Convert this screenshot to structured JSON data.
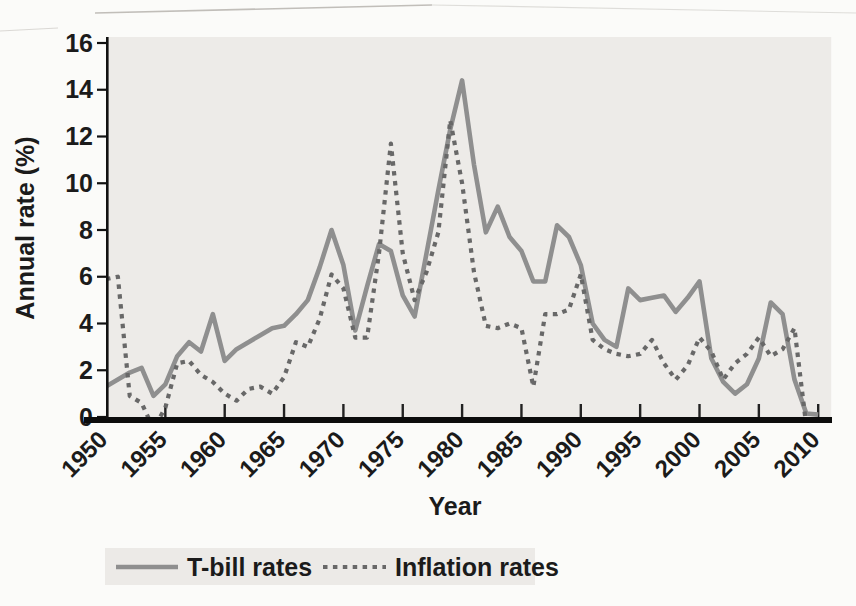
{
  "chart_data": {
    "type": "line",
    "title": "",
    "xlabel": "Year",
    "ylabel": "Annual rate (%)",
    "xlim": [
      1950,
      2010
    ],
    "ylim": [
      0,
      16
    ],
    "grid": false,
    "legend_position": "bottom",
    "plot_background": "#edebe8",
    "x_ticks": [
      1950,
      1955,
      1960,
      1965,
      1970,
      1975,
      1980,
      1985,
      1990,
      1995,
      2000,
      2005,
      2010
    ],
    "y_ticks": [
      0,
      2,
      4,
      6,
      8,
      10,
      12,
      14,
      16
    ],
    "x": [
      1950,
      1951,
      1952,
      1953,
      1954,
      1955,
      1956,
      1957,
      1958,
      1959,
      1960,
      1961,
      1962,
      1963,
      1964,
      1965,
      1966,
      1967,
      1968,
      1969,
      1970,
      1971,
      1972,
      1973,
      1974,
      1975,
      1976,
      1977,
      1978,
      1979,
      1980,
      1981,
      1982,
      1983,
      1984,
      1985,
      1986,
      1987,
      1988,
      1989,
      1990,
      1991,
      1992,
      1993,
      1994,
      1995,
      1996,
      1997,
      1998,
      1999,
      2000,
      2001,
      2002,
      2003,
      2004,
      2005,
      2006,
      2007,
      2008,
      2009,
      2010
    ],
    "series": [
      {
        "name": "T-bill rates",
        "style": "solid",
        "color": "#8f8f8f",
        "values": [
          1.3,
          1.6,
          1.9,
          2.1,
          0.9,
          1.4,
          2.6,
          3.2,
          2.8,
          4.4,
          2.4,
          2.9,
          3.2,
          3.5,
          3.8,
          3.9,
          4.4,
          5.0,
          6.4,
          8.0,
          6.5,
          3.7,
          5.6,
          7.4,
          7.1,
          5.2,
          4.3,
          7.0,
          9.7,
          12.3,
          14.4,
          10.8,
          7.9,
          9.0,
          7.7,
          7.1,
          5.8,
          5.8,
          8.2,
          7.7,
          6.5,
          4.0,
          3.3,
          3.0,
          5.5,
          5.0,
          5.1,
          5.2,
          4.5,
          5.1,
          5.8,
          2.5,
          1.5,
          1.0,
          1.4,
          2.5,
          4.9,
          4.4,
          1.6,
          0.15,
          0.1
        ]
      },
      {
        "name": "Inflation rates",
        "style": "dotted",
        "color": "#686868",
        "values": [
          5.9,
          6.0,
          0.9,
          0.6,
          -0.5,
          0.4,
          2.3,
          2.4,
          1.8,
          1.5,
          1.0,
          0.7,
          1.2,
          1.3,
          1.0,
          1.7,
          3.2,
          3.0,
          4.2,
          6.1,
          5.5,
          3.4,
          3.4,
          7.0,
          11.7,
          7.0,
          5.0,
          6.2,
          7.9,
          12.7,
          10.0,
          6.2,
          3.9,
          3.8,
          4.0,
          3.8,
          1.3,
          4.4,
          4.4,
          4.6,
          6.1,
          3.3,
          2.9,
          2.7,
          2.6,
          2.7,
          3.3,
          2.3,
          1.6,
          2.2,
          3.4,
          2.8,
          1.6,
          2.3,
          2.7,
          3.4,
          2.6,
          2.9,
          3.8,
          -0.4,
          null
        ]
      }
    ]
  }
}
